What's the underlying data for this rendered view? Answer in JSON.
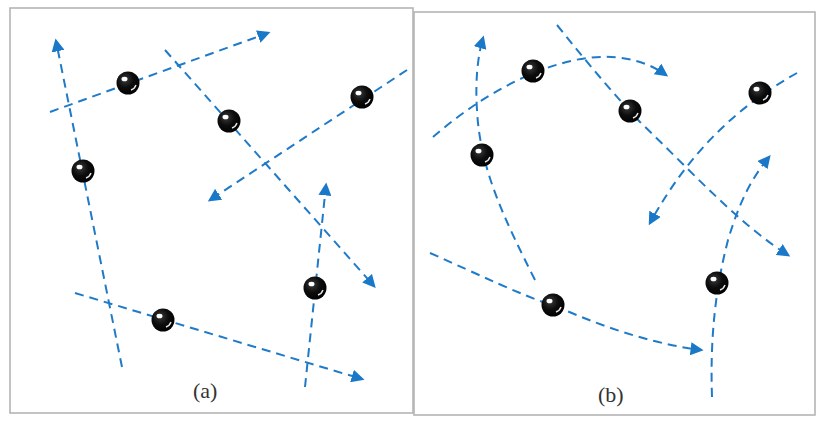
{
  "figure": {
    "panels": [
      {
        "id": "a",
        "caption": "(a)",
        "description": "straight-line trajectories"
      },
      {
        "id": "b",
        "caption": "(b)",
        "description": "curved trajectories"
      }
    ]
  },
  "colors": {
    "path": "#1f7ac8",
    "arrowhead": "#1a78c8",
    "ball": "#0a0a0a",
    "border": "#b5b5b5",
    "caption": "#333333"
  },
  "panel_a": {
    "caption": "(a)",
    "particles": [
      {
        "ball": [
          128,
          83
        ],
        "path_start": [
          50,
          112
        ],
        "arrow_tip": [
          270,
          32
        ]
      },
      {
        "ball": [
          229,
          121
        ],
        "path_start": [
          165,
          50
        ],
        "arrow_tip": [
          376,
          288
        ]
      },
      {
        "ball": [
          362,
          97
        ],
        "path_start": [
          407,
          70
        ],
        "arrow_tip": [
          208,
          201
        ]
      },
      {
        "ball": [
          83,
          171
        ],
        "path_start": [
          122,
          367
        ],
        "arrow_tip": [
          55,
          39
        ]
      },
      {
        "ball": [
          163,
          320
        ],
        "path_start": [
          75,
          293
        ],
        "arrow_tip": [
          364,
          380
        ]
      },
      {
        "ball": [
          315,
          288
        ],
        "path_start": [
          305,
          387
        ],
        "arrow_tip": [
          327,
          183
        ]
      }
    ]
  },
  "panel_b": {
    "caption": "(b)",
    "particles": [
      {
        "ball": [
          533,
          71
        ],
        "path_start": [
          433,
          137
        ],
        "arrow_tip": [
          668,
          76
        ]
      },
      {
        "ball": [
          630,
          111
        ],
        "path_start": [
          557,
          25
        ],
        "arrow_tip": [
          790,
          256
        ]
      },
      {
        "ball": [
          760,
          93
        ],
        "path_start": [
          797,
          73
        ],
        "arrow_tip": [
          649,
          225
        ]
      },
      {
        "ball": [
          482,
          155
        ],
        "path_start": [
          535,
          280
        ],
        "arrow_tip": [
          484,
          36
        ]
      },
      {
        "ball": [
          553,
          305
        ],
        "path_start": [
          430,
          253
        ],
        "arrow_tip": [
          703,
          350
        ]
      },
      {
        "ball": [
          717,
          283
        ],
        "path_start": [
          712,
          397
        ],
        "arrow_tip": [
          771,
          154
        ]
      }
    ]
  }
}
